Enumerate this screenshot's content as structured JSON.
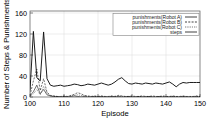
{
  "chart_data": {
    "type": "line",
    "title": "",
    "xlabel": "Episode",
    "ylabel": "Number of Steps & Punishments",
    "xlim": [
      100,
      150
    ],
    "ylim": [
      0,
      160
    ],
    "xticks": [
      100,
      110,
      120,
      130,
      140,
      150
    ],
    "yticks": [
      0,
      40,
      80,
      120,
      160
    ],
    "grid": true,
    "legend_position": "top-right",
    "x": [
      100,
      101,
      102,
      103,
      104,
      105,
      106,
      107,
      108,
      109,
      110,
      111,
      112,
      113,
      114,
      115,
      116,
      117,
      118,
      119,
      120,
      121,
      122,
      123,
      124,
      125,
      126,
      127,
      128,
      129,
      130,
      131,
      132,
      133,
      134,
      135,
      136,
      137,
      138,
      139,
      140,
      141,
      142,
      143,
      144,
      145,
      146,
      147,
      148,
      149,
      150
    ],
    "series": [
      {
        "name": "punishments(Robot A)",
        "dash": "solid",
        "values": [
          2,
          10,
          22,
          6,
          14,
          4,
          2,
          1,
          1,
          0,
          1,
          0,
          1,
          2,
          1,
          0,
          1,
          0,
          0,
          1,
          0,
          1,
          0,
          0,
          1,
          0,
          1,
          0,
          0,
          1,
          0,
          0,
          1,
          0,
          0,
          1,
          0,
          0,
          1,
          0,
          0,
          0,
          1,
          0,
          0,
          1,
          0,
          0,
          0,
          1,
          0
        ]
      },
      {
        "name": "punishments(Robot B)",
        "dash": "dashed",
        "values": [
          3,
          30,
          52,
          12,
          34,
          9,
          3,
          2,
          1,
          1,
          2,
          1,
          3,
          5,
          8,
          6,
          3,
          2,
          1,
          2,
          1,
          2,
          1,
          1,
          2,
          1,
          3,
          2,
          1,
          1,
          2,
          1,
          1,
          2,
          1,
          1,
          2,
          1,
          1,
          2,
          1,
          1,
          2,
          1,
          1,
          2,
          1,
          1,
          1,
          2,
          1
        ]
      },
      {
        "name": "punishments(Robot C)",
        "dash": "dotted",
        "values": [
          1,
          6,
          14,
          4,
          20,
          7,
          2,
          1,
          1,
          0,
          1,
          1,
          2,
          3,
          4,
          3,
          2,
          1,
          1,
          1,
          1,
          1,
          1,
          0,
          1,
          1,
          2,
          1,
          1,
          1,
          1,
          0,
          1,
          1,
          1,
          1,
          1,
          0,
          1,
          1,
          1,
          0,
          1,
          1,
          0,
          1,
          1,
          0,
          1,
          1,
          1
        ]
      },
      {
        "name": "steps",
        "dash": "solid-bold",
        "values": [
          12,
          122,
          36,
          30,
          121,
          34,
          22,
          20,
          21,
          22,
          20,
          21,
          22,
          24,
          23,
          21,
          22,
          24,
          23,
          22,
          24,
          26,
          24,
          22,
          24,
          28,
          33,
          36,
          30,
          25,
          24,
          26,
          25,
          24,
          26,
          25,
          24,
          26,
          25,
          24,
          26,
          28,
          24,
          19,
          24,
          27,
          26,
          27,
          27,
          27,
          27
        ]
      }
    ]
  },
  "legend": {
    "entries": [
      {
        "label": "punishments(Robot A)"
      },
      {
        "label": "punishments(Robot B)"
      },
      {
        "label": "punishments(Robot C)"
      },
      {
        "label": "steps"
      }
    ]
  },
  "footer": {
    "caption_fragment": ""
  }
}
